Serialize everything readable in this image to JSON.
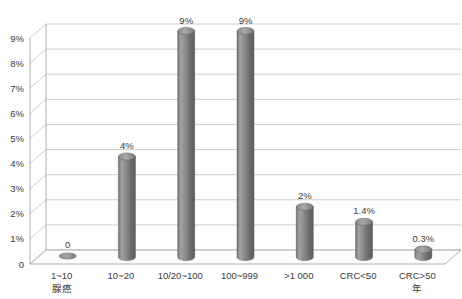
{
  "chart_data": {
    "type": "bar",
    "title": "",
    "subtitle": "",
    "xlabel": "",
    "ylabel": "",
    "ylim": [
      0,
      9
    ],
    "grid": true,
    "legend": "none",
    "style": "3d-cylinder-column",
    "categories": [
      "1~10",
      "10~20",
      "10/20~100",
      "100~999",
      ">1 000",
      "CRC<50",
      "CRC>50"
    ],
    "category_sublabels": [
      "腺癌",
      "",
      "",
      "",
      "",
      "",
      "年"
    ],
    "values": [
      0,
      4,
      9,
      9,
      2,
      1.4,
      0.3
    ],
    "data_labels": [
      "0",
      "4%",
      "9%",
      "9%",
      "2%",
      "1.4%",
      "0.3%"
    ],
    "ytick_labels": [
      "0",
      "1%",
      "2%",
      "3%",
      "4%",
      "5%",
      "6%",
      "7%",
      "8%",
      "9%"
    ],
    "ytick_values": [
      0,
      1,
      2,
      3,
      4,
      5,
      6,
      7,
      8,
      9
    ],
    "colors": {
      "bar_light": "#9d9d9d",
      "bar_mid": "#6e6e6e",
      "bar_dark": "#555555",
      "gridline": "#b9b9b9",
      "axis": "#9a9a9a",
      "text": "#3a3a3a",
      "plot_background": "#ffffff"
    }
  }
}
